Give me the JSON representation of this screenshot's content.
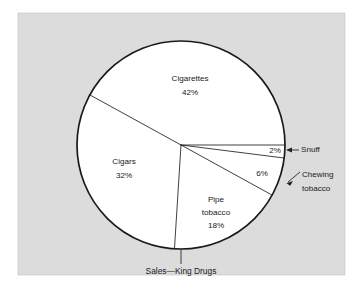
{
  "figure": {
    "caption": "Sales—King Drugs",
    "panel_bg": "#dcdcdc",
    "pie_fill": "#ffffff",
    "line_color": "#1a1a1a"
  },
  "chart_data": {
    "type": "pie",
    "title": "Sales—King Drugs",
    "xlabel": "",
    "ylabel": "",
    "unit": "%",
    "total": 100,
    "start_angle_deg": 0,
    "direction": "clockwise",
    "legend_position": "labels-on-slices",
    "grid": false,
    "categories": [
      "Snuff",
      "Chewing tobacco",
      "Pipe tobacco",
      "Cigars",
      "Cigarettes"
    ],
    "values": [
      2,
      6,
      18,
      32,
      42
    ],
    "slices": [
      {
        "name": "Snuff",
        "value": 2,
        "percent_label": "2%",
        "name_label": "Snuff",
        "label_placement": "outside",
        "label_lines": [
          "Snuff"
        ]
      },
      {
        "name": "Chewing tobacco",
        "value": 6,
        "percent_label": "6%",
        "name_label": "Chewing tobacco",
        "label_placement": "outside",
        "label_lines": [
          "Chewing",
          "tobacco"
        ]
      },
      {
        "name": "Pipe tobacco",
        "value": 18,
        "percent_label": "18%",
        "name_label": "Pipe tobacco",
        "label_placement": "inside",
        "label_lines": [
          "Pipe",
          "tobacco",
          "18%"
        ]
      },
      {
        "name": "Cigars",
        "value": 32,
        "percent_label": "32%",
        "name_label": "Cigars",
        "label_placement": "inside",
        "label_lines": [
          "Cigars",
          "32%"
        ]
      },
      {
        "name": "Cigarettes",
        "value": 42,
        "percent_label": "42%",
        "name_label": "Cigarettes",
        "label_placement": "inside",
        "label_lines": [
          "Cigarettes",
          "42%"
        ]
      }
    ]
  },
  "labels": {
    "cigarettes_name": "Cigarettes",
    "cigarettes_pct": "42%",
    "cigars_name": "Cigars",
    "cigars_pct": "32%",
    "pipe_name_line1": "Pipe",
    "pipe_name_line2": "tobacco",
    "pipe_pct": "18%",
    "snuff_pct": "2%",
    "snuff_name": "Snuff",
    "chewing_pct": "6%",
    "chewing_name_line1": "Chewing",
    "chewing_name_line2": "tobacco"
  }
}
